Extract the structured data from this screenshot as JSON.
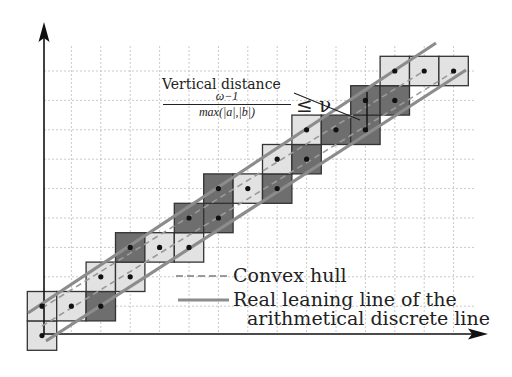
{
  "figure": {
    "colors": {
      "light_cell": "#e2e2e2",
      "dark_cell": "#6e6e6e",
      "cell_border": "#333333",
      "leaning_line": "#8a8a8a",
      "hull_line": "#aaaaaa",
      "grid": "#bbbbbb",
      "axis": "#111111",
      "point": "#111111"
    },
    "grid": {
      "x0": 42,
      "y0": 71,
      "step": 29.4,
      "cols": 15,
      "rows": 10
    },
    "cells": [
      {
        "col": 0,
        "row": 9,
        "shade": "light"
      },
      {
        "col": 0,
        "row": 8,
        "shade": "light"
      },
      {
        "col": 1,
        "row": 8,
        "shade": "light"
      },
      {
        "col": 2,
        "row": 8,
        "shade": "dark"
      },
      {
        "col": 2,
        "row": 7,
        "shade": "light"
      },
      {
        "col": 3,
        "row": 7,
        "shade": "light"
      },
      {
        "col": 3,
        "row": 6,
        "shade": "dark"
      },
      {
        "col": 4,
        "row": 6,
        "shade": "light"
      },
      {
        "col": 5,
        "row": 6,
        "shade": "light"
      },
      {
        "col": 5,
        "row": 5,
        "shade": "dark"
      },
      {
        "col": 6,
        "row": 5,
        "shade": "dark"
      },
      {
        "col": 6,
        "row": 4,
        "shade": "dark"
      },
      {
        "col": 7,
        "row": 4,
        "shade": "light"
      },
      {
        "col": 8,
        "row": 4,
        "shade": "dark"
      },
      {
        "col": 8,
        "row": 3,
        "shade": "light"
      },
      {
        "col": 9,
        "row": 3,
        "shade": "dark"
      },
      {
        "col": 9,
        "row": 2,
        "shade": "light"
      },
      {
        "col": 10,
        "row": 2,
        "shade": "dark"
      },
      {
        "col": 11,
        "row": 2,
        "shade": "dark"
      },
      {
        "col": 11,
        "row": 1,
        "shade": "dark"
      },
      {
        "col": 12,
        "row": 1,
        "shade": "dark"
      },
      {
        "col": 12,
        "row": 0,
        "shade": "light"
      },
      {
        "col": 13,
        "row": 0,
        "shade": "light"
      },
      {
        "col": 14,
        "row": 0,
        "shade": "light"
      }
    ],
    "annotation": {
      "title": "Vertical distance",
      "numerator": "ω−1",
      "denominator": "max(|a|,|b|)",
      "relation": "≤ ν"
    },
    "legend": [
      {
        "style": "dashed",
        "label": "Convex hull"
      },
      {
        "style": "solid",
        "label_line1": "Real leaning line of the",
        "label_line2": "arithmetical discrete line"
      }
    ]
  }
}
